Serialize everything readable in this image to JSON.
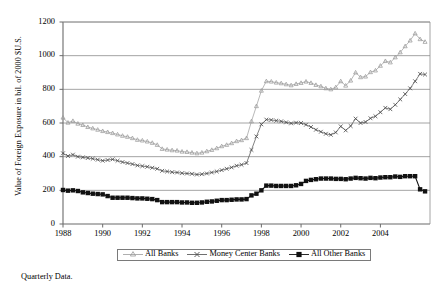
{
  "chart_data": {
    "type": "line",
    "title": "",
    "xlabel": "",
    "ylabel": "Value of Foreign Exposure in bil. of 2000 $U.S.",
    "footnote": "Quarterly Data.",
    "grid": true,
    "legend_position": "bottom",
    "xlim": [
      1988.0,
      2006.5
    ],
    "ylim": [
      0,
      1200
    ],
    "yticks": [
      0,
      200,
      400,
      600,
      800,
      1000,
      1200
    ],
    "ytick_labels": [
      "0",
      "200",
      "400",
      "600",
      "800",
      "1000",
      "1200"
    ],
    "xticks": [
      1988,
      1990,
      1992,
      1994,
      1996,
      1998,
      2000,
      2002,
      2004
    ],
    "xtick_labels": [
      "1988",
      "1990",
      "1992",
      "1994",
      "1996",
      "1998",
      "2000",
      "2002",
      "2004"
    ],
    "x": [
      1988.0,
      1988.25,
      1988.5,
      1988.75,
      1989.0,
      1989.25,
      1989.5,
      1989.75,
      1990.0,
      1990.25,
      1990.5,
      1990.75,
      1991.0,
      1991.25,
      1991.5,
      1991.75,
      1992.0,
      1992.25,
      1992.5,
      1992.75,
      1993.0,
      1993.25,
      1993.5,
      1993.75,
      1994.0,
      1994.25,
      1994.5,
      1994.75,
      1995.0,
      1995.25,
      1995.5,
      1995.75,
      1996.0,
      1996.25,
      1996.5,
      1996.75,
      1997.0,
      1997.25,
      1997.5,
      1997.75,
      1998.0,
      1998.25,
      1998.5,
      1998.75,
      1999.0,
      1999.25,
      1999.5,
      1999.75,
      2000.0,
      2000.25,
      2000.5,
      2000.75,
      2001.0,
      2001.25,
      2001.5,
      2001.75,
      2002.0,
      2002.25,
      2002.5,
      2002.75,
      2003.0,
      2003.25,
      2003.5,
      2003.75,
      2004.0,
      2004.25,
      2004.5,
      2004.75,
      2005.0,
      2005.25,
      2005.5,
      2005.75,
      2006.0,
      2006.25
    ],
    "series": [
      {
        "name": "All Banks",
        "marker": "triangle",
        "color": "#9a9a9a",
        "values": [
          632,
          602,
          612,
          596,
          588,
          576,
          568,
          560,
          552,
          546,
          540,
          532,
          524,
          518,
          510,
          500,
          496,
          490,
          482,
          470,
          446,
          442,
          438,
          436,
          430,
          428,
          424,
          420,
          424,
          432,
          440,
          450,
          462,
          470,
          480,
          492,
          498,
          510,
          610,
          700,
          792,
          848,
          846,
          840,
          836,
          830,
          824,
          832,
          838,
          846,
          838,
          826,
          818,
          806,
          800,
          812,
          848,
          822,
          852,
          900,
          872,
          876,
          902,
          912,
          940,
          968,
          960,
          990,
          1020,
          1056,
          1090,
          1132,
          1098,
          1082
        ]
      },
      {
        "name": "Money Center Banks",
        "marker": "cross",
        "color": "#4a4a4a",
        "values": [
          420,
          404,
          412,
          400,
          396,
          392,
          388,
          382,
          376,
          380,
          384,
          376,
          368,
          362,
          356,
          348,
          344,
          340,
          334,
          328,
          316,
          312,
          308,
          306,
          302,
          300,
          298,
          294,
          296,
          300,
          306,
          312,
          320,
          328,
          336,
          346,
          352,
          362,
          440,
          520,
          592,
          620,
          618,
          614,
          610,
          604,
          598,
          602,
          600,
          590,
          576,
          560,
          548,
          536,
          530,
          544,
          580,
          556,
          582,
          626,
          600,
          606,
          628,
          640,
          664,
          690,
          682,
          708,
          740,
          772,
          806,
          848,
          892,
          888
        ]
      },
      {
        "name": "All Other Banks",
        "marker": "square",
        "color": "#111111",
        "values": [
          202,
          198,
          200,
          196,
          188,
          184,
          180,
          178,
          176,
          166,
          156,
          156,
          156,
          156,
          154,
          152,
          152,
          150,
          148,
          142,
          130,
          130,
          130,
          130,
          128,
          128,
          126,
          126,
          128,
          132,
          134,
          138,
          142,
          142,
          144,
          146,
          146,
          148,
          170,
          180,
          200,
          228,
          228,
          226,
          226,
          226,
          226,
          230,
          238,
          256,
          262,
          266,
          270,
          270,
          270,
          268,
          268,
          266,
          270,
          274,
          272,
          270,
          274,
          272,
          276,
          278,
          278,
          282,
          280,
          284,
          284,
          284,
          206,
          194
        ]
      }
    ]
  }
}
